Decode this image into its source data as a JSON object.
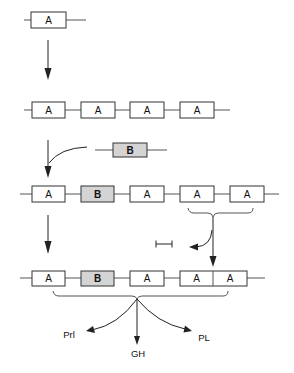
{
  "diagram": {
    "title": "",
    "colors": {
      "box_a_fill": "#ffffff",
      "box_b_fill": "#d4d4d4",
      "stroke": "#333333"
    },
    "rows": [
      {
        "step": 1,
        "genes": [
          "A"
        ]
      },
      {
        "step": 2,
        "genes": [
          "A",
          "A",
          "A",
          "A"
        ]
      },
      {
        "step": "insert",
        "genes": [
          "B"
        ]
      },
      {
        "step": 3,
        "genes": [
          "A",
          "B",
          "A",
          "A",
          "A"
        ]
      },
      {
        "step": 4,
        "genes": [
          "A",
          "B",
          "A",
          "A|A"
        ]
      }
    ],
    "labels": {
      "r1_a1": "A",
      "r2_a1": "A",
      "r2_a2": "A",
      "r2_a3": "A",
      "r2_a4": "A",
      "ins_b": "B",
      "r3_a1": "A",
      "r3_b": "B",
      "r3_a2": "A",
      "r3_a3": "A",
      "r3_a4": "A",
      "r4_a1": "A",
      "r4_b": "B",
      "r4_a2": "A",
      "r4_a3": "A",
      "r4_a4": "A"
    },
    "deletion_symbol": "⊢⊣",
    "products": {
      "left": "Prl",
      "center": "GH",
      "right": "PL"
    }
  }
}
